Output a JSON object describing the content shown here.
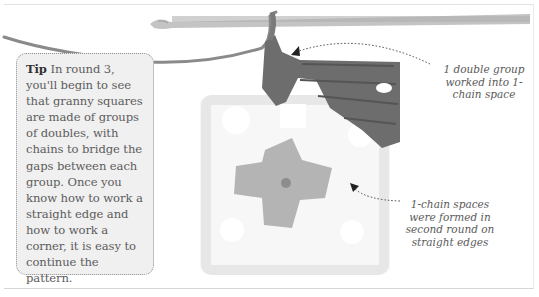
{
  "tip": {
    "label": "Tip",
    "text": " In round 3, you'll begin to see that granny squares are made of groups of doubles, with chains to bridge the gaps between each group. Once you know how to work a straight edge and how to work a corner, it is easy to continue the pattern."
  },
  "callouts": [
    {
      "text": "1 double group worked into 1-chain space"
    },
    {
      "text": "1-chain spaces were formed in second round on straight edges"
    }
  ],
  "illustration": {
    "subject": "granny-square-crochet-photo",
    "colors": {
      "hook": "#bdbdbd",
      "dark_yarn": "#6f6f6f",
      "center_yarn": "#b3b3b3",
      "white_yarn": "#f6f6f6",
      "tip_bg": "#f0f0f0"
    }
  }
}
